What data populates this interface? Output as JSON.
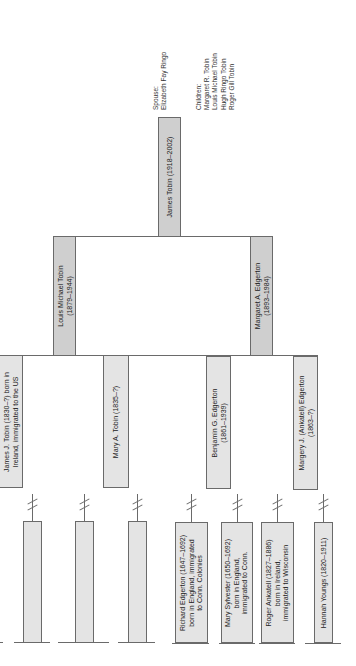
{
  "root": {
    "name": "James Tobin (1918–2002)",
    "spouse_label": "Spouse:",
    "spouse": "Elizabeth Fay Ringo",
    "children_label": "Children:",
    "children": [
      "Margaret R. Tobin",
      "Louis Michael Tobin",
      "Hugh Ringo Tobin",
      "Roger Gill Tobin"
    ]
  },
  "parents": [
    {
      "line1": "Louis Michael Tobin",
      "line2": "(1879–1944)"
    },
    {
      "line1": "Margaret A. Edgerton",
      "line2": "(1893–1984)"
    }
  ],
  "grandparents": [
    {
      "line1": "James J. Tobin (1830–?) born in",
      "line2": "Ireland, immigrated to the US"
    },
    {
      "line1": "Mary A. Tobin (1835–?)",
      "line2": ""
    },
    {
      "line1": "Benjamin G. Edgerton",
      "line2": "(1861–1939)"
    },
    {
      "line1": "Margery J. (Ankatell) Edgerton",
      "line2": "(1863–?)"
    }
  ],
  "ancestors": [
    {
      "lines": []
    },
    {
      "lines": []
    },
    {
      "lines": []
    },
    {
      "lines": [
        "Richard Edgerton (1647–1692)",
        "born in England, immigrated",
        "to Conn. Colonies"
      ]
    },
    {
      "lines": [
        "Mary Sylvester (1650–1692)",
        "born in England,",
        "immigrated to Conn."
      ]
    },
    {
      "lines": [
        "Roger Ankatell (1827–1886)",
        "born in Ireland,",
        "immigrated to Wisconsin"
      ]
    },
    {
      "lines": [
        "Hannah Youngs (1820–1911)"
      ]
    }
  ],
  "colors": {
    "older_gen_box": "#cfcfcf",
    "ancestor_box": "#e4e4e4",
    "line": "#6a6a6a"
  }
}
